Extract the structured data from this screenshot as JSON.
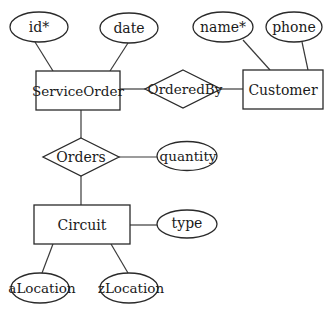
{
  "diagram": {
    "type": "er-diagram",
    "entities": [
      {
        "id": "serviceorder",
        "label": "ServiceOrder",
        "x": 36,
        "y": 71,
        "w": 84,
        "h": 39
      },
      {
        "id": "customer",
        "label": "Customer",
        "x": 243,
        "y": 70,
        "w": 80,
        "h": 39
      },
      {
        "id": "circuit",
        "label": "Circuit",
        "x": 34,
        "y": 205,
        "w": 96,
        "h": 39
      }
    ],
    "relationships": [
      {
        "id": "orderedby",
        "label": "OrderedBy",
        "cx": 183,
        "cy": 89,
        "rx": 38,
        "ry": 19
      },
      {
        "id": "orders",
        "label": "Orders",
        "cx": 81,
        "cy": 157,
        "rx": 38,
        "ry": 19
      }
    ],
    "attributes": [
      {
        "id": "id",
        "label": "id*",
        "cx": 39,
        "cy": 27,
        "rx": 29,
        "ry": 15,
        "key": true
      },
      {
        "id": "date",
        "label": "date",
        "cx": 129,
        "cy": 28,
        "rx": 29,
        "ry": 15,
        "key": false
      },
      {
        "id": "name",
        "label": "name*",
        "cx": 223,
        "cy": 27,
        "rx": 30,
        "ry": 15,
        "key": true
      },
      {
        "id": "phone",
        "label": "phone",
        "cx": 294,
        "cy": 27,
        "rx": 28,
        "ry": 15,
        "key": false
      },
      {
        "id": "quantity",
        "label": "quantity",
        "cx": 187,
        "cy": 156,
        "rx": 30,
        "ry": 14.5,
        "key": false
      },
      {
        "id": "type",
        "label": "type",
        "cx": 187,
        "cy": 224,
        "rx": 30,
        "ry": 14,
        "key": false
      },
      {
        "id": "alocation",
        "label": "aLocation",
        "cx": 40,
        "cy": 288,
        "rx": 29,
        "ry": 15,
        "key": false
      },
      {
        "id": "zlocation",
        "label": "zLocation",
        "cx": 129,
        "cy": 288,
        "rx": 29,
        "ry": 15,
        "key": false
      }
    ],
    "edges": [
      {
        "from": "id",
        "to": "serviceorder"
      },
      {
        "from": "date",
        "to": "serviceorder"
      },
      {
        "from": "serviceorder",
        "to": "orderedby"
      },
      {
        "from": "orderedby",
        "to": "customer"
      },
      {
        "from": "name",
        "to": "customer"
      },
      {
        "from": "phone",
        "to": "customer"
      },
      {
        "from": "serviceorder",
        "to": "orders"
      },
      {
        "from": "orders",
        "to": "quantity"
      },
      {
        "from": "orders",
        "to": "circuit"
      },
      {
        "from": "circuit",
        "to": "type"
      },
      {
        "from": "circuit",
        "to": "alocation"
      },
      {
        "from": "circuit",
        "to": "zlocation"
      }
    ],
    "colors": {
      "stroke": "#2a2a2a",
      "fill": "#ffffff",
      "text": "#1a1a1a"
    }
  }
}
